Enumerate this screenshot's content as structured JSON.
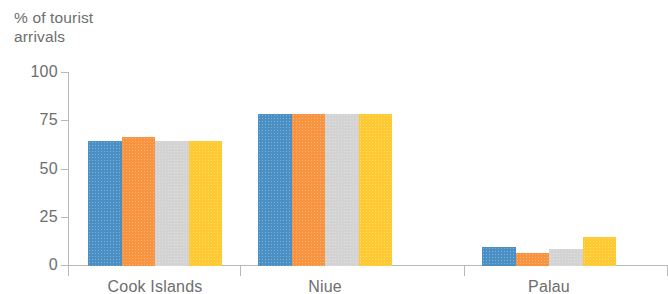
{
  "chart_data": {
    "type": "bar",
    "title": "",
    "ylabel": "% of tourist\narrivals",
    "xlabel": "",
    "ylim": [
      0,
      100
    ],
    "yticks": [
      0,
      25,
      50,
      75,
      100
    ],
    "ytick_labels": [
      "0",
      "25",
      "50",
      "75",
      "100"
    ],
    "grid": false,
    "legend": "none",
    "categories": [
      "Cook Islands",
      "Niue",
      "Palau"
    ],
    "series": [
      {
        "name": "series-1",
        "color": "#4a90c4",
        "values": [
          65,
          79,
          10
        ]
      },
      {
        "name": "series-2",
        "color": "#f89440",
        "values": [
          67,
          79,
          7
        ]
      },
      {
        "name": "series-3",
        "color": "#d3d3d3",
        "values": [
          65,
          79,
          9
        ]
      },
      {
        "name": "series-4",
        "color": "#ffc932",
        "values": [
          65,
          79,
          15
        ]
      }
    ]
  },
  "axis": {
    "line_color": "#b8b8b8",
    "text_color": "#6e6e6e"
  }
}
